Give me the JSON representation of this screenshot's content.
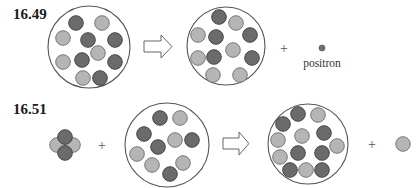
{
  "colors": {
    "proton": "#6b6b6b",
    "proton_stroke": "#444444",
    "neutron": "#b5b5b5",
    "neutron_stroke": "#777777",
    "positron": "#707070"
  },
  "problems": [
    {
      "label": "16.49",
      "reactant_nucleus": {
        "protons": 6,
        "neutrons": 5
      },
      "product_nucleus": {
        "protons": 5,
        "neutrons": 6
      },
      "emitted_particle": "positron",
      "emitted_label": "positron",
      "operators": [
        "arrow",
        "+"
      ]
    },
    {
      "label": "16.51",
      "projectile": {
        "name": "alpha-particle",
        "protons": 2,
        "neutrons": 2
      },
      "target_nucleus": {
        "protons": 5,
        "neutrons": 5
      },
      "product_nucleus": {
        "protons": 7,
        "neutrons": 6
      },
      "emitted_particle": "neutron",
      "operators": [
        "+",
        "arrow",
        "+"
      ]
    }
  ],
  "plus_sign": "+"
}
